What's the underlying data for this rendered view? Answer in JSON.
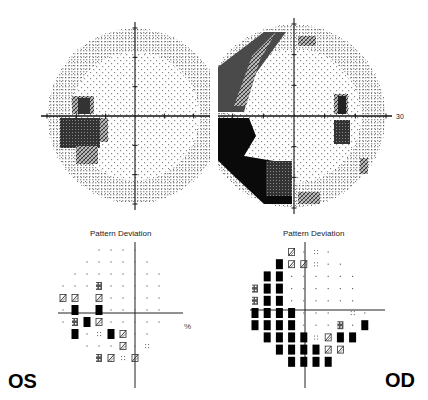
{
  "os": {
    "eye_label": "OS",
    "axis_label": "30",
    "pattern_title": "Pattern Deviation",
    "percent_label": "%",
    "grayscale_defects": [
      {
        "region": "superior-temporal paracentral",
        "density": "dark",
        "quadrant": "upper-left"
      },
      {
        "region": "inferior-temporal paracentral",
        "density": "dark",
        "quadrant": "lower-left"
      }
    ],
    "pattern_rows": [
      {
        "cols": [
          3,
          4,
          5,
          6
        ],
        "vals": [
          "n",
          "n",
          "n",
          "n"
        ]
      },
      {
        "cols": [
          2,
          3,
          4,
          5,
          6,
          7
        ],
        "vals": [
          "n",
          "n",
          "n",
          "n",
          "n",
          "n"
        ]
      },
      {
        "cols": [
          1,
          2,
          3,
          4,
          5,
          6,
          7,
          8
        ],
        "vals": [
          "n",
          "n",
          "n",
          "n",
          "n",
          "n",
          "n",
          "n"
        ]
      },
      {
        "cols": [
          0,
          1,
          2,
          3,
          4,
          5,
          6,
          7,
          8
        ],
        "vals": [
          "n",
          "n",
          "n",
          "p1",
          "n",
          "n",
          "n",
          "n",
          "n"
        ]
      },
      {
        "cols": [
          0,
          1,
          3,
          4,
          5,
          6,
          7,
          8
        ],
        "vals": [
          "p2",
          "p2",
          "p2",
          "n",
          "n",
          "n",
          "n",
          "n"
        ]
      },
      {
        "cols": [
          0,
          1,
          3,
          4,
          5,
          6,
          7,
          8
        ],
        "vals": [
          "n",
          "p05",
          "p05",
          "n",
          "n",
          "n",
          "n",
          "n"
        ]
      },
      {
        "cols": [
          0,
          1,
          2,
          3,
          4,
          5,
          6,
          7,
          8
        ],
        "vals": [
          "n",
          "p1",
          "p05",
          "p2",
          "n",
          "n",
          "n",
          "n",
          "n"
        ]
      },
      {
        "cols": [
          1,
          2,
          3,
          4,
          5,
          6,
          7
        ],
        "vals": [
          "p05",
          "n",
          "p5",
          "p05",
          "p2",
          "n",
          "n"
        ]
      },
      {
        "cols": [
          2,
          3,
          4,
          5,
          6,
          7
        ],
        "vals": [
          "n",
          "n",
          "n",
          "p2",
          "n",
          "p5"
        ]
      },
      {
        "cols": [
          3,
          4,
          5,
          6
        ],
        "vals": [
          "p1",
          "p2",
          "p5",
          "p2"
        ]
      }
    ]
  },
  "od": {
    "eye_label": "OD",
    "axis_label": "30",
    "pattern_title": "Pattern Deviation",
    "grayscale_defects": [
      {
        "region": "superior-temporal arcuate",
        "density": "medium",
        "quadrant": "upper-left"
      },
      {
        "region": "inferior-temporal arcuate",
        "density": "black",
        "quadrant": "lower-left"
      },
      {
        "region": "blind spot",
        "density": "dark",
        "quadrant": "right"
      }
    ],
    "pattern_rows": [
      {
        "cols": [
          3,
          4,
          5,
          6
        ],
        "vals": [
          "p2",
          "n",
          "p5",
          "n"
        ]
      },
      {
        "cols": [
          2,
          3,
          4,
          5,
          6,
          7
        ],
        "vals": [
          "p05",
          "p2",
          "p2",
          "p5",
          "n",
          "n"
        ]
      },
      {
        "cols": [
          1,
          2,
          3,
          4,
          5,
          6,
          7,
          8
        ],
        "vals": [
          "p05",
          "p05",
          "n",
          "n",
          "n",
          "n",
          "n",
          "n"
        ]
      },
      {
        "cols": [
          0,
          1,
          2,
          3,
          4,
          5,
          6,
          7,
          8
        ],
        "vals": [
          "p1",
          "p05",
          "p05",
          "n",
          "n",
          "n",
          "n",
          "n",
          "n"
        ]
      },
      {
        "cols": [
          0,
          1,
          2,
          3,
          4,
          5,
          6,
          7,
          8
        ],
        "vals": [
          "p1",
          "p05",
          "p05",
          "n",
          "n",
          "n",
          "n",
          "n",
          "n"
        ]
      },
      {
        "cols": [
          0,
          1,
          2,
          3,
          4,
          5,
          6,
          7,
          8,
          9
        ],
        "vals": [
          "p05",
          "p05",
          "p05",
          "p05",
          "n",
          "n",
          "n",
          "",
          "p5",
          "n"
        ]
      },
      {
        "cols": [
          0,
          1,
          2,
          3,
          4,
          5,
          6,
          7,
          8,
          9
        ],
        "vals": [
          "p05",
          "p05",
          "p05",
          "p05",
          "n",
          "n",
          "n",
          "p1",
          "n",
          "p05"
        ]
      },
      {
        "cols": [
          1,
          2,
          3,
          4,
          5,
          6,
          7,
          8
        ],
        "vals": [
          "p05",
          "p05",
          "p05",
          "p05",
          "p5",
          "p2",
          "p05",
          "p05"
        ]
      },
      {
        "cols": [
          2,
          3,
          4,
          5,
          6,
          7
        ],
        "vals": [
          "p05",
          "p05",
          "p05",
          "p05",
          "p2",
          "p2"
        ]
      },
      {
        "cols": [
          3,
          4,
          5,
          6
        ],
        "vals": [
          "p05",
          "p05",
          "p05",
          "p05"
        ]
      }
    ]
  },
  "legend": {
    "n": "normal",
    "p5": "p < 5%",
    "p2": "p < 2%",
    "p1": "p < 1%",
    "p05": "p < 0.5%"
  }
}
